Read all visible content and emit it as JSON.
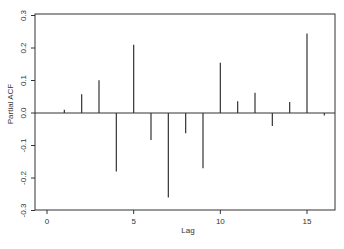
{
  "chart_data": {
    "type": "bar",
    "subtype": "partial-autocorrelation-spikes",
    "title": "",
    "xlabel": "Lag",
    "ylabel": "Partial ACF",
    "xlim": [
      -0.7,
      16.6
    ],
    "ylim": [
      -0.3,
      0.3
    ],
    "x_ticks": [
      0,
      5,
      10,
      15
    ],
    "x_tick_labels": [
      "0",
      "5",
      "10",
      "15"
    ],
    "y_ticks": [
      -0.3,
      -0.2,
      -0.1,
      0.0,
      0.1,
      0.2,
      0.3
    ],
    "y_tick_labels": [
      "-0.3",
      "-0.2",
      "-0.1",
      "0.0",
      "0.1",
      "0.2",
      "0.3"
    ],
    "grid": false,
    "legend": null,
    "zero_line": true,
    "x": [
      1,
      2,
      3,
      4,
      5,
      6,
      7,
      8,
      9,
      10,
      11,
      12,
      13,
      14,
      15,
      16
    ],
    "values": [
      0.01,
      0.058,
      0.101,
      -0.18,
      0.21,
      -0.083,
      -0.26,
      -0.062,
      -0.17,
      0.155,
      0.036,
      0.062,
      -0.04,
      0.034,
      0.245,
      -0.008
    ]
  },
  "colors": {
    "line": "#333333",
    "frame": "#333333",
    "background": "#ffffff"
  }
}
